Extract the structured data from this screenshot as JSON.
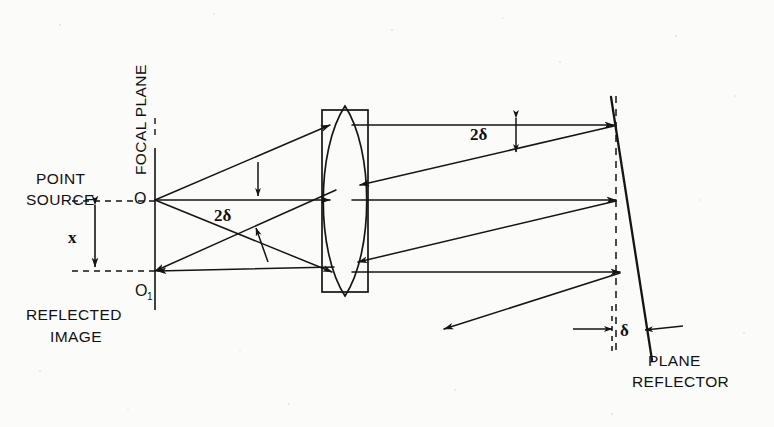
{
  "figure": {
    "type": "optical-ray-diagram",
    "background_color": "#fbfbf9",
    "ink_color": "#151515"
  },
  "labels": {
    "focal_plane": "FOCAL PLANE",
    "point_source_line1": "POINT",
    "point_source_line2": "SOURCE",
    "point_source_mark": "O",
    "reflected_image_mark": "O",
    "reflected_image_mark_sub": "1",
    "reflected_line1": "REFLECTED",
    "reflected_line2": "IMAGE",
    "separation": "x",
    "angle_upper": "2δ",
    "angle_lower": "2δ",
    "tilt": "δ",
    "reflector_line1": "PLANE",
    "reflector_line2": "REFLECTOR"
  },
  "geometry": {
    "focal_plane_x": 155,
    "source_point": {
      "x": 155,
      "y": 200
    },
    "image_point": {
      "x": 155,
      "y": 271
    },
    "lens_frame": {
      "x": 322,
      "y": 110,
      "width": 46,
      "height": 182
    },
    "lens_center_x": 345,
    "mirror_top": {
      "x": 613,
      "y": 108
    },
    "mirror_bottom": {
      "x": 650,
      "y": 352
    },
    "dashed_normal_x": 616,
    "outgoing_ray_heights": [
      125,
      200,
      272
    ]
  }
}
